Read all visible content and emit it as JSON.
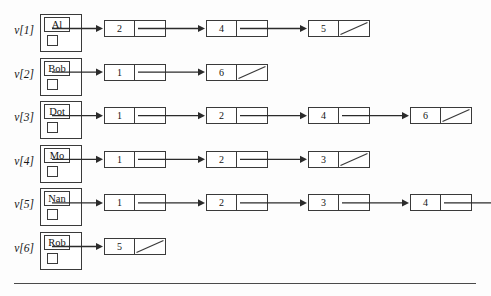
{
  "figure": {
    "type": "adjacency-list",
    "background_color": "#fdfdfd",
    "line_color": "#3a3a3a",
    "text_color": "#131313",
    "rule": {
      "present": true
    }
  },
  "rows": [
    {
      "index_label": "v[1]",
      "vertex_name": "Al",
      "nodes": [
        {
          "value": "2",
          "null_link": false
        },
        {
          "value": "4",
          "null_link": false
        },
        {
          "value": "5",
          "null_link": true
        }
      ]
    },
    {
      "index_label": "v[2]",
      "vertex_name": "Bob",
      "nodes": [
        {
          "value": "1",
          "null_link": false
        },
        {
          "value": "6",
          "null_link": true
        }
      ]
    },
    {
      "index_label": "v[3]",
      "vertex_name": "Dot",
      "nodes": [
        {
          "value": "1",
          "null_link": false
        },
        {
          "value": "2",
          "null_link": false
        },
        {
          "value": "4",
          "null_link": false
        },
        {
          "value": "6",
          "null_link": true
        }
      ]
    },
    {
      "index_label": "v[4]",
      "vertex_name": "Mo",
      "nodes": [
        {
          "value": "1",
          "null_link": false
        },
        {
          "value": "2",
          "null_link": false
        },
        {
          "value": "3",
          "null_link": true
        }
      ]
    },
    {
      "index_label": "v[5]",
      "vertex_name": "Nan",
      "nodes": [
        {
          "value": "1",
          "null_link": false
        },
        {
          "value": "2",
          "null_link": false
        },
        {
          "value": "3",
          "null_link": false
        },
        {
          "value": "4",
          "null_link": false
        },
        {
          "value": "6",
          "null_link": true
        }
      ]
    },
    {
      "index_label": "v[6]",
      "vertex_name": "Rob",
      "nodes": [
        {
          "value": "5",
          "null_link": true
        }
      ]
    }
  ]
}
